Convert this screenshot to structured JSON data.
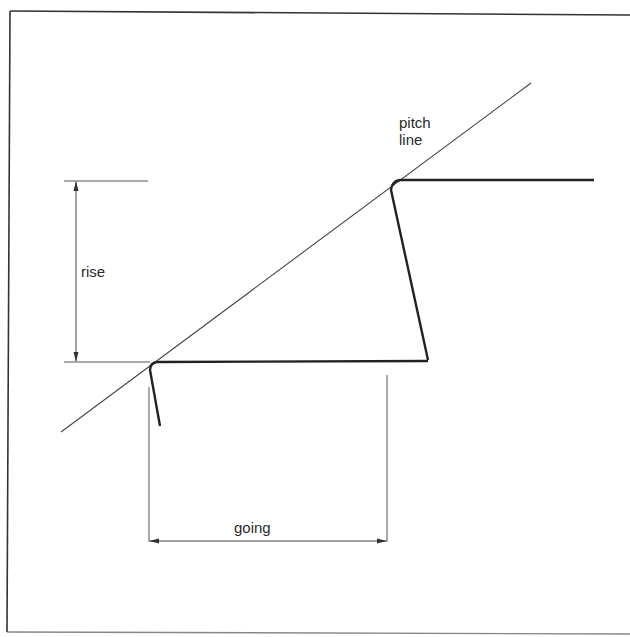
{
  "diagram": {
    "labels": {
      "pitch_line_1": "pitch",
      "pitch_line_2": "line",
      "rise": "rise",
      "going": "going"
    },
    "colors": {
      "background": "#ffffff",
      "stroke": "#222222",
      "thin_stroke": "#444444",
      "text": "#2a2a2a"
    },
    "elements": [
      {
        "id": "frame",
        "type": "border"
      },
      {
        "id": "pitch-line",
        "type": "line",
        "from": [
          61,
          432
        ],
        "to": [
          531,
          83
        ]
      },
      {
        "id": "upper-tread",
        "type": "line",
        "from": [
          398,
          180
        ],
        "to": [
          594,
          180
        ]
      },
      {
        "id": "upper-riser",
        "type": "line",
        "from": [
          391,
          188
        ],
        "to": [
          428,
          360
        ]
      },
      {
        "id": "lower-tread",
        "type": "line",
        "from": [
          155,
          362
        ],
        "to": [
          428,
          361
        ]
      },
      {
        "id": "lower-riser",
        "type": "line",
        "from": [
          150,
          368
        ],
        "to": [
          160,
          426
        ]
      },
      {
        "id": "rise-dimension",
        "type": "dimension",
        "from": [
          76,
          181
        ],
        "to": [
          76,
          362
        ]
      },
      {
        "id": "going-dimension",
        "type": "dimension",
        "from": [
          150,
          541
        ],
        "to": [
          387,
          541
        ]
      }
    ]
  }
}
